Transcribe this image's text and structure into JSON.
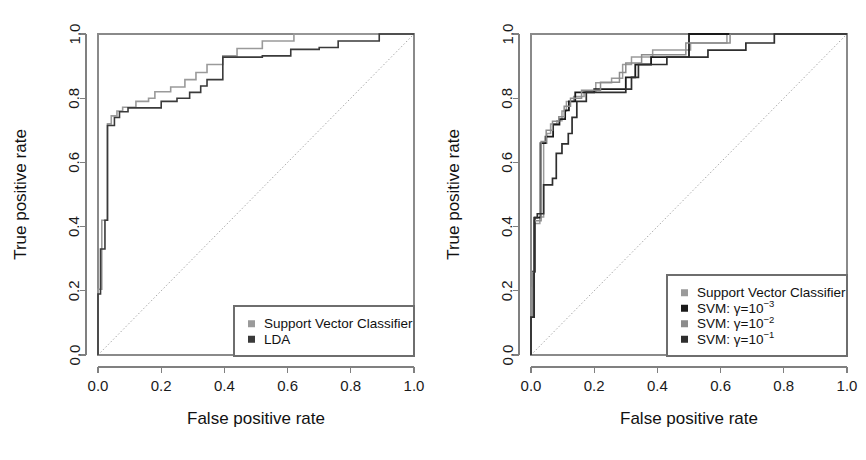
{
  "figure": {
    "background": "#ffffff",
    "panel_count": 2
  },
  "chart_data": [
    {
      "type": "line",
      "panel": "left",
      "title": "",
      "xlabel": "False positive rate",
      "ylabel": "True positive rate",
      "xlim": [
        0.0,
        1.0
      ],
      "ylim": [
        0.0,
        1.0
      ],
      "xticks": [
        "0.0",
        "0.2",
        "0.4",
        "0.6",
        "0.8",
        "1.0"
      ],
      "yticks": [
        "0.0",
        "0.2",
        "0.4",
        "0.6",
        "0.8",
        "1.0"
      ],
      "grid": false,
      "legend_position": "bottom-right",
      "reference_line": {
        "label": "chance diagonal",
        "from": [
          0.0,
          0.0
        ],
        "to": [
          1.0,
          1.0
        ],
        "style": "dotted"
      },
      "series": [
        {
          "name": "Support Vector Classifier",
          "color": "#9a9a9a",
          "linewidth": 1.6,
          "points": [
            [
              0.0,
              0.0
            ],
            [
              0.0,
              0.205
            ],
            [
              0.012,
              0.205
            ],
            [
              0.012,
              0.33
            ],
            [
              0.012,
              0.42
            ],
            [
              0.03,
              0.42
            ],
            [
              0.03,
              0.72
            ],
            [
              0.042,
              0.72
            ],
            [
              0.042,
              0.745
            ],
            [
              0.06,
              0.745
            ],
            [
              0.06,
              0.76
            ],
            [
              0.078,
              0.76
            ],
            [
              0.078,
              0.772
            ],
            [
              0.12,
              0.772
            ],
            [
              0.12,
              0.79
            ],
            [
              0.16,
              0.79
            ],
            [
              0.16,
              0.8
            ],
            [
              0.18,
              0.8
            ],
            [
              0.18,
              0.82
            ],
            [
              0.23,
              0.82
            ],
            [
              0.23,
              0.835
            ],
            [
              0.275,
              0.835
            ],
            [
              0.275,
              0.858
            ],
            [
              0.31,
              0.858
            ],
            [
              0.31,
              0.88
            ],
            [
              0.345,
              0.88
            ],
            [
              0.345,
              0.905
            ],
            [
              0.395,
              0.905
            ],
            [
              0.395,
              0.932
            ],
            [
              0.44,
              0.932
            ],
            [
              0.44,
              0.955
            ],
            [
              0.52,
              0.955
            ],
            [
              0.52,
              0.978
            ],
            [
              0.62,
              0.978
            ],
            [
              0.62,
              1.0
            ],
            [
              1.0,
              1.0
            ]
          ]
        },
        {
          "name": "LDA",
          "color": "#3a3a3a",
          "linewidth": 1.6,
          "points": [
            [
              0.0,
              0.0
            ],
            [
              0.0,
              0.19
            ],
            [
              0.008,
              0.19
            ],
            [
              0.008,
              0.33
            ],
            [
              0.022,
              0.33
            ],
            [
              0.022,
              0.42
            ],
            [
              0.03,
              0.42
            ],
            [
              0.03,
              0.715
            ],
            [
              0.052,
              0.715
            ],
            [
              0.052,
              0.74
            ],
            [
              0.068,
              0.74
            ],
            [
              0.068,
              0.758
            ],
            [
              0.095,
              0.758
            ],
            [
              0.095,
              0.77
            ],
            [
              0.2,
              0.77
            ],
            [
              0.2,
              0.79
            ],
            [
              0.25,
              0.79
            ],
            [
              0.25,
              0.8
            ],
            [
              0.29,
              0.8
            ],
            [
              0.29,
              0.818
            ],
            [
              0.325,
              0.818
            ],
            [
              0.325,
              0.838
            ],
            [
              0.345,
              0.838
            ],
            [
              0.345,
              0.858
            ],
            [
              0.395,
              0.858
            ],
            [
              0.395,
              0.928
            ],
            [
              0.52,
              0.928
            ],
            [
              0.52,
              0.932
            ],
            [
              0.61,
              0.932
            ],
            [
              0.61,
              0.952
            ],
            [
              0.7,
              0.952
            ],
            [
              0.7,
              0.958
            ],
            [
              0.76,
              0.958
            ],
            [
              0.76,
              0.978
            ],
            [
              0.89,
              0.978
            ],
            [
              0.89,
              1.0
            ],
            [
              1.0,
              1.0
            ]
          ]
        }
      ],
      "legend": [
        {
          "label": "Support Vector Classifier",
          "color": "#9a9a9a",
          "marker": "square"
        },
        {
          "label": "LDA",
          "color": "#3a3a3a",
          "marker": "square"
        }
      ]
    },
    {
      "type": "line",
      "panel": "right",
      "title": "",
      "xlabel": "False positive rate",
      "ylabel": "True positive rate",
      "xlim": [
        0.0,
        1.0
      ],
      "ylim": [
        0.0,
        1.0
      ],
      "xticks": [
        "0.0",
        "0.2",
        "0.4",
        "0.6",
        "0.8",
        "1.0"
      ],
      "yticks": [
        "0.0",
        "0.2",
        "0.4",
        "0.6",
        "0.8",
        "1.0"
      ],
      "grid": false,
      "legend_position": "bottom-right",
      "reference_line": {
        "label": "chance diagonal",
        "from": [
          0.0,
          0.0
        ],
        "to": [
          1.0,
          1.0
        ],
        "style": "dotted"
      },
      "series": [
        {
          "name": "Support Vector Classifier",
          "color": "#9a9a9a",
          "linewidth": 1.5,
          "points": [
            [
              0.0,
              0.0
            ],
            [
              0.0,
              0.12
            ],
            [
              0.004,
              0.12
            ],
            [
              0.004,
              0.21
            ],
            [
              0.008,
              0.21
            ],
            [
              0.008,
              0.258
            ],
            [
              0.012,
              0.258
            ],
            [
              0.012,
              0.41
            ],
            [
              0.028,
              0.41
            ],
            [
              0.028,
              0.43
            ],
            [
              0.04,
              0.43
            ],
            [
              0.04,
              0.66
            ],
            [
              0.05,
              0.66
            ],
            [
              0.05,
              0.69
            ],
            [
              0.062,
              0.69
            ],
            [
              0.062,
              0.72
            ],
            [
              0.082,
              0.72
            ],
            [
              0.082,
              0.73
            ],
            [
              0.098,
              0.73
            ],
            [
              0.098,
              0.76
            ],
            [
              0.112,
              0.76
            ],
            [
              0.112,
              0.79
            ],
            [
              0.135,
              0.79
            ],
            [
              0.135,
              0.805
            ],
            [
              0.168,
              0.805
            ],
            [
              0.168,
              0.82
            ],
            [
              0.205,
              0.82
            ],
            [
              0.205,
              0.848
            ],
            [
              0.255,
              0.848
            ],
            [
              0.255,
              0.862
            ],
            [
              0.29,
              0.862
            ],
            [
              0.29,
              0.905
            ],
            [
              0.318,
              0.905
            ],
            [
              0.318,
              0.928
            ],
            [
              0.385,
              0.928
            ],
            [
              0.385,
              0.95
            ],
            [
              0.505,
              0.95
            ],
            [
              0.505,
              0.972
            ],
            [
              0.62,
              0.972
            ],
            [
              0.62,
              1.0
            ],
            [
              1.0,
              1.0
            ]
          ]
        },
        {
          "name": "SVM: γ=10⁻³",
          "gamma": "1e-3",
          "color": "#1a1a1a",
          "linewidth": 1.8,
          "points": [
            [
              0.0,
              0.0
            ],
            [
              0.0,
              0.118
            ],
            [
              0.006,
              0.118
            ],
            [
              0.006,
              0.26
            ],
            [
              0.012,
              0.26
            ],
            [
              0.012,
              0.428
            ],
            [
              0.03,
              0.428
            ],
            [
              0.03,
              0.66
            ],
            [
              0.046,
              0.66
            ],
            [
              0.046,
              0.68
            ],
            [
              0.07,
              0.68
            ],
            [
              0.07,
              0.718
            ],
            [
              0.09,
              0.718
            ],
            [
              0.09,
              0.735
            ],
            [
              0.108,
              0.735
            ],
            [
              0.108,
              0.762
            ],
            [
              0.12,
              0.762
            ],
            [
              0.12,
              0.79
            ],
            [
              0.14,
              0.79
            ],
            [
              0.14,
              0.818
            ],
            [
              0.2,
              0.818
            ],
            [
              0.2,
              0.828
            ],
            [
              0.3,
              0.828
            ],
            [
              0.3,
              0.865
            ],
            [
              0.33,
              0.865
            ],
            [
              0.33,
              0.905
            ],
            [
              0.38,
              0.905
            ],
            [
              0.38,
              0.928
            ],
            [
              0.5,
              0.928
            ],
            [
              0.5,
              1.0
            ],
            [
              1.0,
              1.0
            ]
          ]
        },
        {
          "name": "SVM: γ=10⁻²",
          "gamma": "1e-2",
          "color": "#8c8c8c",
          "linewidth": 1.5,
          "points": [
            [
              0.0,
              0.0
            ],
            [
              0.0,
              0.12
            ],
            [
              0.005,
              0.12
            ],
            [
              0.005,
              0.258
            ],
            [
              0.01,
              0.258
            ],
            [
              0.01,
              0.418
            ],
            [
              0.032,
              0.418
            ],
            [
              0.032,
              0.665
            ],
            [
              0.048,
              0.665
            ],
            [
              0.048,
              0.7
            ],
            [
              0.068,
              0.7
            ],
            [
              0.068,
              0.728
            ],
            [
              0.088,
              0.728
            ],
            [
              0.088,
              0.742
            ],
            [
              0.105,
              0.742
            ],
            [
              0.105,
              0.775
            ],
            [
              0.125,
              0.775
            ],
            [
              0.125,
              0.8
            ],
            [
              0.16,
              0.8
            ],
            [
              0.16,
              0.825
            ],
            [
              0.22,
              0.825
            ],
            [
              0.22,
              0.85
            ],
            [
              0.28,
              0.85
            ],
            [
              0.28,
              0.88
            ],
            [
              0.3,
              0.88
            ],
            [
              0.3,
              0.91
            ],
            [
              0.35,
              0.91
            ],
            [
              0.35,
              0.935
            ],
            [
              0.49,
              0.935
            ],
            [
              0.49,
              0.972
            ],
            [
              0.63,
              0.972
            ],
            [
              0.63,
              1.0
            ],
            [
              1.0,
              1.0
            ]
          ]
        },
        {
          "name": "SVM: γ=10⁻¹",
          "gamma": "1e-1",
          "color": "#2e2e2e",
          "linewidth": 1.7,
          "points": [
            [
              0.0,
              0.0
            ],
            [
              0.0,
              0.118
            ],
            [
              0.01,
              0.118
            ],
            [
              0.01,
              0.428
            ],
            [
              0.02,
              0.428
            ],
            [
              0.02,
              0.44
            ],
            [
              0.04,
              0.44
            ],
            [
              0.04,
              0.53
            ],
            [
              0.068,
              0.53
            ],
            [
              0.068,
              0.55
            ],
            [
              0.08,
              0.55
            ],
            [
              0.08,
              0.628
            ],
            [
              0.098,
              0.628
            ],
            [
              0.098,
              0.658
            ],
            [
              0.118,
              0.658
            ],
            [
              0.118,
              0.69
            ],
            [
              0.13,
              0.69
            ],
            [
              0.13,
              0.74
            ],
            [
              0.145,
              0.74
            ],
            [
              0.145,
              0.79
            ],
            [
              0.175,
              0.79
            ],
            [
              0.175,
              0.818
            ],
            [
              0.3,
              0.818
            ],
            [
              0.3,
              0.828
            ],
            [
              0.318,
              0.828
            ],
            [
              0.318,
              0.865
            ],
            [
              0.34,
              0.865
            ],
            [
              0.34,
              0.905
            ],
            [
              0.43,
              0.905
            ],
            [
              0.43,
              0.928
            ],
            [
              0.56,
              0.928
            ],
            [
              0.56,
              0.95
            ],
            [
              0.68,
              0.95
            ],
            [
              0.68,
              0.972
            ],
            [
              0.77,
              0.972
            ],
            [
              0.77,
              1.0
            ],
            [
              1.0,
              1.0
            ]
          ]
        }
      ],
      "legend": [
        {
          "label": "Support Vector Classifier",
          "color": "#9a9a9a",
          "marker": "square"
        },
        {
          "label": "SVM: γ=10",
          "sup": "−3",
          "color": "#1a1a1a",
          "marker": "square"
        },
        {
          "label": "SVM: γ=10",
          "sup": "−2",
          "color": "#8c8c8c",
          "marker": "square"
        },
        {
          "label": "SVM: γ=10",
          "sup": "−1",
          "color": "#2e2e2e",
          "marker": "square"
        }
      ]
    }
  ]
}
